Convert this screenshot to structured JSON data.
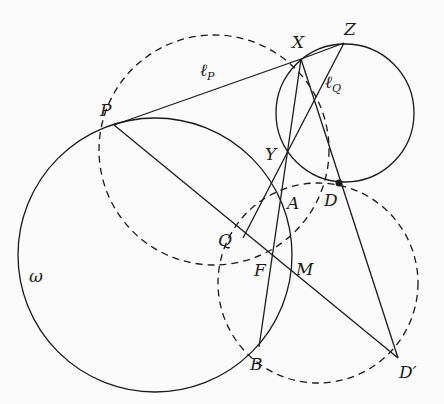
{
  "diagram": {
    "type": "geometry-figure",
    "stroke_color": "#1a1a1a",
    "background": "#fbfbfb",
    "circles": [
      {
        "name": "omega",
        "label": "ω",
        "cx": 155,
        "cy": 255,
        "r": 137,
        "style": "solid"
      },
      {
        "name": "circle-XZYD",
        "cx": 345,
        "cy": 113,
        "r": 69,
        "style": "solid"
      },
      {
        "name": "circle-PXDF",
        "cx": 214,
        "cy": 150,
        "r": 115,
        "style": "dashed"
      },
      {
        "name": "circle-DBD'",
        "cx": 318,
        "cy": 283,
        "r": 100,
        "style": "dashed"
      }
    ],
    "points": [
      {
        "name": "P",
        "x": 114,
        "y": 125
      },
      {
        "name": "X",
        "x": 301,
        "y": 59
      },
      {
        "name": "Z",
        "x": 344,
        "y": 43
      },
      {
        "name": "Y",
        "x": 287,
        "y": 152
      },
      {
        "name": "D",
        "x": 339,
        "y": 183,
        "filled": true
      },
      {
        "name": "A",
        "x": 282,
        "y": 197
      },
      {
        "name": "Q",
        "x": 243,
        "y": 238
      },
      {
        "name": "F",
        "x": 271,
        "y": 257
      },
      {
        "name": "M",
        "x": 293,
        "y": 275
      },
      {
        "name": "B",
        "x": 259,
        "y": 347
      },
      {
        "name": "D'",
        "x": 398,
        "y": 358
      }
    ],
    "labels": {
      "P": "P",
      "X": "X",
      "Z": "Z",
      "Y": "Y",
      "D": "D",
      "A": "A",
      "Q": "Q",
      "F": "F",
      "M": "M",
      "B": "B",
      "Dp": "D′",
      "omega": "ω",
      "lP_main": "ℓ",
      "lP_sub": "P",
      "lQ_main": "ℓ",
      "lQ_sub": "Q"
    },
    "segments": [
      {
        "from": "P",
        "to": "X",
        "label": "ℓP"
      },
      {
        "from": "X",
        "to": "Z"
      },
      {
        "from": "P",
        "to": "D'"
      },
      {
        "from": "X",
        "to": "B"
      },
      {
        "from": "Z",
        "to": "Q",
        "label": "ℓQ"
      },
      {
        "from": "X",
        "to": "D'"
      }
    ]
  }
}
